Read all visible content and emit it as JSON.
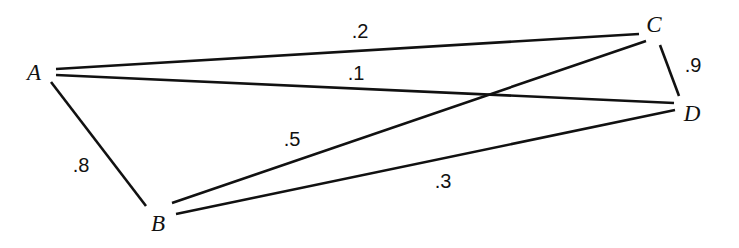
{
  "figure": {
    "type": "node-link-diagram",
    "background_color": "#ffffff",
    "stroke_color": "#111111",
    "text_color": "#111111",
    "width": 739,
    "height": 248
  },
  "nodes": [
    {
      "id": "A",
      "label": "A",
      "x": 34,
      "y": 72
    },
    {
      "id": "B",
      "label": "B",
      "x": 158,
      "y": 223
    },
    {
      "id": "C",
      "label": "C",
      "x": 654,
      "y": 24
    },
    {
      "id": "D",
      "label": "D",
      "x": 692,
      "y": 113
    }
  ],
  "edges": [
    {
      "id": "A-C",
      "from": "A",
      "to": "C",
      "weight": ".2",
      "label_x": 360,
      "label_y": 31,
      "x1": 56,
      "y1": 69,
      "x2": 639,
      "y2": 34
    },
    {
      "id": "A-D",
      "from": "A",
      "to": "D",
      "weight": ".1",
      "label_x": 356,
      "label_y": 73,
      "x1": 56,
      "y1": 75,
      "x2": 674,
      "y2": 103
    },
    {
      "id": "A-B",
      "from": "A",
      "to": "B",
      "weight": ".8",
      "label_x": 81,
      "label_y": 165,
      "x1": 51,
      "y1": 82,
      "x2": 146,
      "y2": 206
    },
    {
      "id": "B-C",
      "from": "B",
      "to": "C",
      "weight": ".5",
      "label_x": 292,
      "label_y": 139,
      "x1": 172,
      "y1": 203,
      "x2": 646,
      "y2": 41
    },
    {
      "id": "B-D",
      "from": "B",
      "to": "D",
      "weight": ".3",
      "label_x": 443,
      "label_y": 181,
      "x1": 176,
      "y1": 214,
      "x2": 675,
      "y2": 110
    },
    {
      "id": "C-D",
      "from": "C",
      "to": "D",
      "weight": ".9",
      "label_x": 693,
      "label_y": 65,
      "x1": 660,
      "y1": 45,
      "x2": 679,
      "y2": 96
    }
  ]
}
